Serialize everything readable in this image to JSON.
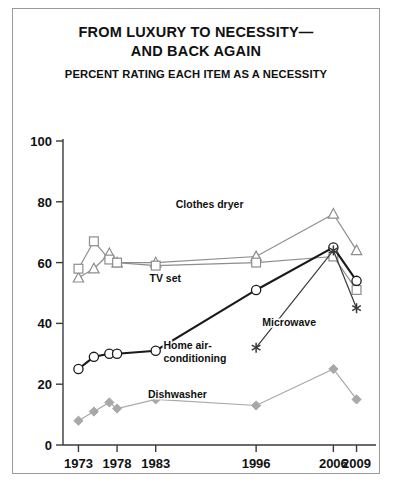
{
  "title": {
    "line1": "FROM LUXURY TO NECESSITY—",
    "line2": "AND BACK AGAIN",
    "subtitle": "PERCENT RATING EACH ITEM AS A NECESSITY"
  },
  "chart_data": {
    "type": "line",
    "title": "FROM LUXURY TO NECESSITY— AND BACK AGAIN",
    "subtitle": "PERCENT RATING EACH ITEM AS A NECESSITY",
    "xlabel": "",
    "ylabel": "",
    "ylim": [
      0,
      100
    ],
    "yticks": [
      0,
      20,
      40,
      60,
      80,
      100
    ],
    "ytick_labels": [
      "0",
      "20",
      "40",
      "60",
      "80",
      "100"
    ],
    "xlim": [
      1971,
      2011
    ],
    "xticks": [
      1973,
      1978,
      1983,
      1996,
      2006,
      2009
    ],
    "xtick_labels": [
      "1973",
      "1978",
      "1983",
      "1996",
      "2006",
      "2009"
    ],
    "grid": false,
    "legend": "inline-annotations",
    "series": [
      {
        "name": "Clothes dryer",
        "marker": "triangle",
        "color": "#8d8d8d",
        "label_x": 1985.6,
        "label_y": 78,
        "x": [
          1973,
          1975,
          1977,
          1978,
          1983,
          1996,
          2006,
          2009
        ],
        "values": [
          55,
          58,
          63,
          60,
          60,
          62,
          76,
          64
        ]
      },
      {
        "name": "TV set",
        "marker": "square",
        "color": "#8d8d8d",
        "label_x": 1982.2,
        "label_y": 53.5,
        "x": [
          1973,
          1975,
          1977,
          1978,
          1983,
          1996,
          2006,
          2009
        ],
        "values": [
          58,
          67,
          61,
          60,
          59,
          60,
          62,
          51
        ]
      },
      {
        "name": "Home air-conditioning",
        "marker": "circle",
        "color": "#1a1a1a",
        "label_x": 1984.0,
        "label_y": 31.5,
        "label_lines": [
          "Home air-",
          "conditioning"
        ],
        "x": [
          1973,
          1975,
          1977,
          1978,
          1983,
          1996,
          2006,
          2009
        ],
        "values": [
          25,
          29,
          30,
          30,
          31,
          51,
          65,
          54
        ]
      },
      {
        "name": "Microwave",
        "marker": "asterisk",
        "color": "#3a3a3a",
        "label_x": 1996.8,
        "label_y": 39,
        "x": [
          1996,
          2006,
          2009
        ],
        "values": [
          32,
          64,
          45
        ]
      },
      {
        "name": "Dishwasher",
        "marker": "diamond",
        "color": "#a8a8a8",
        "label_x": 1982.0,
        "label_y": 15.5,
        "x": [
          1973,
          1975,
          1977,
          1978,
          1983,
          1996,
          2006,
          2009
        ],
        "values": [
          8,
          11,
          14,
          12,
          15,
          13,
          25,
          15
        ]
      }
    ]
  }
}
